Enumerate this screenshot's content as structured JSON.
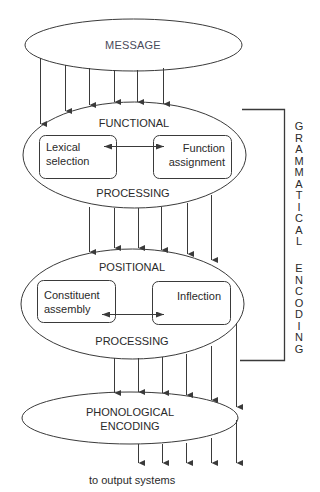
{
  "diagram": {
    "type": "flow",
    "nodes": {
      "message": {
        "label": "MESSAGE"
      },
      "functional": {
        "top_label": "FUNCTIONAL",
        "bottom_label": "PROCESSING",
        "boxes": [
          {
            "line1": "Lexical",
            "line2": "selection"
          },
          {
            "line1": "Function",
            "line2": "assignment"
          }
        ]
      },
      "positional": {
        "top_label": "POSITIONAL",
        "bottom_label": "PROCESSING",
        "boxes": [
          {
            "line1": "Constituent",
            "line2": "assembly"
          },
          {
            "line1": "Inflection",
            "line2": ""
          }
        ]
      },
      "phonological": {
        "line1": "PHONOLOGICAL",
        "line2": "ENCODING"
      }
    },
    "bracket_label": {
      "word1": [
        "G",
        "R",
        "A",
        "M",
        "M",
        "A",
        "T",
        "I",
        "C",
        "A",
        "L"
      ],
      "word2": [
        "E",
        "N",
        "C",
        "O",
        "D",
        "I",
        "N",
        "G"
      ],
      "full": "GRAMMATICAL ENCODING"
    },
    "output_label": "to output systems",
    "edges": [
      {
        "from": "message",
        "to": "functional",
        "count": 6
      },
      {
        "from": "functional",
        "to": "positional",
        "count": 6
      },
      {
        "from": "positional",
        "to": "phonological",
        "count": 4
      },
      {
        "from": "functional",
        "to": "phonological",
        "count": 2
      },
      {
        "from": "phonological",
        "to": "output",
        "count": 5
      },
      {
        "from": "lexical-selection",
        "to": "function-assignment",
        "bidirectional": true
      },
      {
        "from": "constituent-assembly",
        "to": "inflection",
        "bidirectional": true
      }
    ],
    "colors": {
      "line": "#3a3a3a",
      "text": "#2a2a2a",
      "background": "#ffffff"
    }
  }
}
